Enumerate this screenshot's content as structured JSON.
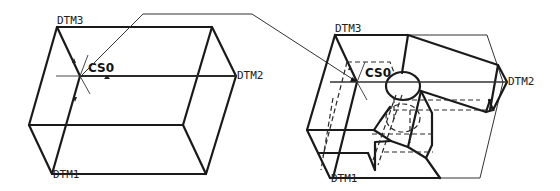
{
  "figure": {
    "left_view": {
      "labels": {
        "top_datum": "DTM3",
        "right_datum": "DTM2",
        "bottom_datum": "DTM1",
        "coordinate_system": "CS0"
      }
    },
    "right_view": {
      "labels": {
        "top_datum": "DTM3",
        "right_datum": "DTM2",
        "bottom_datum": "DTM1",
        "coordinate_system": "CS0"
      }
    },
    "leader_line": "connects left CS0 to right CS0"
  }
}
